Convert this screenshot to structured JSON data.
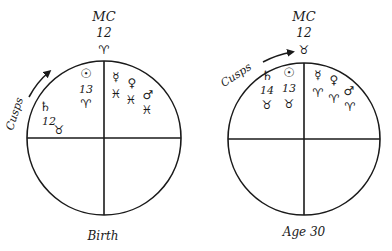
{
  "charts": [
    {
      "id": "birth",
      "caption": "Birth",
      "mc": {
        "label": "MC",
        "degree": "12",
        "sign": "♈",
        "sign_name": "aries"
      },
      "cusps_label": "Cusps",
      "planets": [
        {
          "name": "sun",
          "glyph": "☉",
          "degree": "13",
          "sign": "♈",
          "sign_name": "aries"
        },
        {
          "name": "saturn",
          "glyph": "♄",
          "degree": "12",
          "sign": "♉",
          "sign_name": "taurus"
        },
        {
          "name": "mercury",
          "glyph": "☿",
          "degree": "",
          "sign": "♓",
          "sign_name": "pisces"
        },
        {
          "name": "venus",
          "glyph": "♀",
          "degree": "",
          "sign": "♓",
          "sign_name": "pisces"
        },
        {
          "name": "mars",
          "glyph": "♂",
          "degree": "",
          "sign": "♓",
          "sign_name": "pisces"
        }
      ]
    },
    {
      "id": "age30",
      "caption": "Age 30",
      "mc": {
        "label": "MC",
        "degree": "12",
        "sign": "♉",
        "sign_name": "taurus"
      },
      "cusps_label": "Cusps",
      "planets": [
        {
          "name": "saturn",
          "glyph": "♄",
          "degree": "14",
          "sign": "♉",
          "sign_name": "taurus"
        },
        {
          "name": "sun",
          "glyph": "☉",
          "degree": "13",
          "sign": "♉",
          "sign_name": "taurus"
        },
        {
          "name": "mercury",
          "glyph": "☿",
          "degree": "",
          "sign": "♈",
          "sign_name": "aries"
        },
        {
          "name": "venus",
          "glyph": "♀",
          "degree": "",
          "sign": "♈",
          "sign_name": "aries"
        },
        {
          "name": "mars",
          "glyph": "♂",
          "degree": "",
          "sign": "♈",
          "sign_name": "aries"
        }
      ]
    }
  ]
}
